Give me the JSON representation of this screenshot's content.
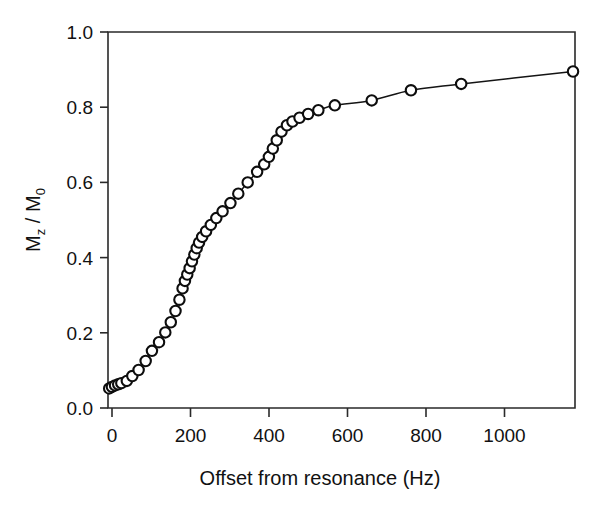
{
  "figure": {
    "kind": "scatter-with-fitted-curve",
    "background_color": "#ffffff",
    "ink_color": "#141414"
  },
  "axes": {
    "x_title": "Offset from resonance (Hz)",
    "y_title_main": "M",
    "y_title_sub1": "z",
    "y_title_mid": " / M",
    "y_title_sub2": "0",
    "y_title_plain": "Mz / M0",
    "x_tick_labels": [
      "0",
      "200",
      "400",
      "600",
      "800",
      "1000"
    ],
    "y_tick_labels": [
      "0.0",
      "0.2",
      "0.4",
      "0.6",
      "0.8",
      "1.0"
    ]
  },
  "chart_data": {
    "type": "scatter",
    "title": "",
    "xlabel": "Offset from resonance (Hz)",
    "ylabel": "Mz / M0",
    "xlim": [
      0,
      1190
    ],
    "ylim": [
      0.0,
      1.0
    ],
    "xticks": [
      0,
      200,
      400,
      600,
      800,
      1000
    ],
    "yticks": [
      0.0,
      0.2,
      0.4,
      0.6,
      0.8,
      1.0
    ],
    "grid": false,
    "legend": null,
    "marker": "open-circle",
    "line": "solid-connecting-curve",
    "series": [
      {
        "name": "Mz / M0",
        "x": [
          3,
          10,
          18,
          26,
          34,
          48,
          62,
          78,
          96,
          112,
          130,
          146,
          160,
          172,
          182,
          190,
          196,
          202,
          208,
          214,
          220,
          226,
          232,
          240,
          250,
          262,
          276,
          292,
          312,
          332,
          356,
          380,
          398,
          410,
          420,
          430,
          442,
          456,
          470,
          488,
          510,
          536,
          578,
          672,
          772,
          900,
          1185
        ],
        "y": [
          0.052,
          0.056,
          0.06,
          0.063,
          0.066,
          0.072,
          0.085,
          0.101,
          0.125,
          0.152,
          0.175,
          0.201,
          0.228,
          0.258,
          0.288,
          0.318,
          0.338,
          0.355,
          0.372,
          0.39,
          0.408,
          0.425,
          0.44,
          0.455,
          0.47,
          0.487,
          0.505,
          0.523,
          0.545,
          0.57,
          0.6,
          0.628,
          0.648,
          0.668,
          0.69,
          0.712,
          0.735,
          0.752,
          0.762,
          0.772,
          0.782,
          0.792,
          0.805,
          0.818,
          0.845,
          0.862,
          0.895
        ]
      }
    ]
  }
}
